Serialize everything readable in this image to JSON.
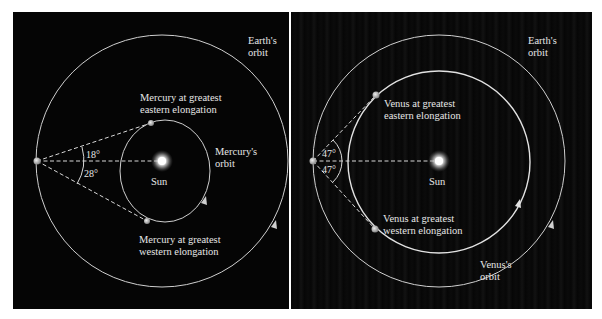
{
  "left_panel": {
    "earth_orbit_label": [
      "Earth's",
      "orbit"
    ],
    "planet_orbit_label": [
      "Mercury's",
      "orbit"
    ],
    "eastern_label": [
      "Mercury at greatest",
      "eastern elongation"
    ],
    "western_label": [
      "Mercury at greatest",
      "western elongation"
    ],
    "sun_label": "Sun",
    "angle_east": "18°",
    "angle_west": "28°"
  },
  "right_panel": {
    "earth_orbit_label": [
      "Earth's",
      "orbit"
    ],
    "planet_orbit_label": [
      "Venus's",
      "orbit"
    ],
    "eastern_label": [
      "Venus at greatest",
      "eastern elongation"
    ],
    "western_label": [
      "Venus at greatest",
      "western elongation"
    ],
    "sun_label": "Sun",
    "angle_east": "47°",
    "angle_west": "47°"
  },
  "colors": {
    "background": "#050505",
    "line": "#d8d8d8",
    "text": "#e6e6e6",
    "sun": "#ffffff"
  }
}
